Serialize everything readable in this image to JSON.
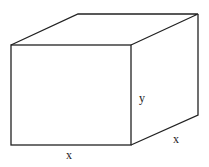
{
  "diagram": {
    "type": "rectangular box (cuboid)",
    "labels": {
      "height": "y",
      "depth": "x",
      "width": "x"
    },
    "colors": {
      "stroke": "#222222",
      "background": "#ffffff"
    }
  }
}
